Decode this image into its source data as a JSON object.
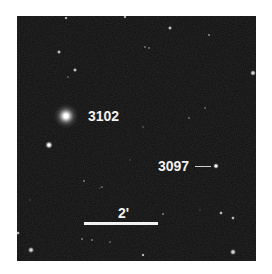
{
  "image": {
    "background_color": "#0e0e0e",
    "frame_color": "#ffffff"
  },
  "labels": {
    "galaxy_a": "3102",
    "galaxy_b": "3097",
    "scale": "2'"
  },
  "objects": {
    "galaxy_a": {
      "x": 66,
      "y": 116,
      "type": "bright-diffuse-galaxy"
    },
    "galaxy_b": {
      "x": 216,
      "y": 166,
      "type": "compact-galaxy"
    }
  }
}
